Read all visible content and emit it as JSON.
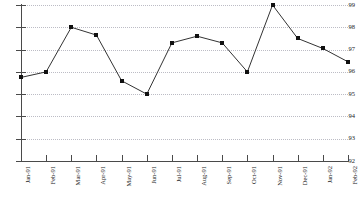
{
  "chart_data": {
    "type": "line",
    "title": "",
    "subtitle": "",
    "xlabel": "",
    "ylabel": "",
    "categories": [
      "Jan-91",
      "Feb-91",
      "Mar-91",
      "Apr-91",
      "May-91",
      "Jun-91",
      "Jul-91",
      "Aug-91",
      "Sep-91",
      "Oct-91",
      "Nov-91",
      "Dec-91",
      "Jan-92",
      "Feb-92"
    ],
    "values": [
      95.75,
      96.0,
      98.0,
      97.65,
      95.6,
      95.0,
      97.3,
      97.6,
      97.3,
      96.0,
      99.0,
      97.5,
      97.05,
      96.45
    ],
    "ylim": [
      92,
      99
    ],
    "yticks": [
      92,
      93,
      94,
      95,
      96,
      97,
      98,
      99
    ],
    "ytick_labels": [
      "92",
      "93",
      "94",
      "95",
      "96",
      "97",
      "98",
      "99"
    ],
    "grid": true,
    "grid_axis": "y",
    "grid_style": "dotted",
    "legend": false,
    "legend_position": "none",
    "marker": "square",
    "series": [
      {
        "name": "",
        "values": [
          95.75,
          96.0,
          98.0,
          97.65,
          95.6,
          95.0,
          97.3,
          97.6,
          97.3,
          96.0,
          99.0,
          97.5,
          97.05,
          96.45
        ]
      }
    ],
    "colors": {
      "line": "#333333",
      "marker": "#111111",
      "grid": "#b9b9c2",
      "axis": "#4a4a4a",
      "text": "#1a1a1a",
      "background": "#ffffff"
    }
  }
}
